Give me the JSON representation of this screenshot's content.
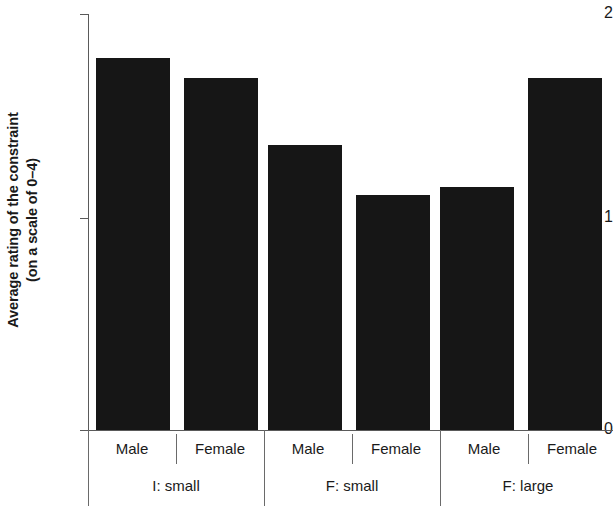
{
  "chart_data": {
    "type": "bar",
    "title": "",
    "subtitle": "",
    "xlabel": "",
    "ylabel_line1": "Average rating of the constraint",
    "ylabel_line2": "(on a scale of 0–4)",
    "ylim": [
      0,
      2
    ],
    "yticks": [
      "0",
      "1",
      "2"
    ],
    "ytick_values": [
      0,
      1,
      2
    ],
    "grid": false,
    "legend": "none",
    "groups": [
      {
        "label": "I: small",
        "categories": [
          "Male",
          "Female"
        ],
        "values": [
          1.79,
          1.69
        ]
      },
      {
        "label": "F: small",
        "categories": [
          "Male",
          "Female"
        ],
        "values": [
          1.37,
          1.13
        ]
      },
      {
        "label": "F: large",
        "categories": [
          "Male",
          "Female"
        ],
        "values": [
          1.17,
          1.69
        ]
      }
    ],
    "categories": [
      "Male",
      "Female",
      "Male",
      "Female",
      "Male",
      "Female"
    ],
    "values": [
      1.79,
      1.69,
      1.37,
      1.13,
      1.17,
      1.69
    ],
    "bar_color": "#161616",
    "axis_color": "#5a5a5a"
  },
  "axis": {
    "tick0": "0",
    "tick1": "1",
    "tick2": "2"
  },
  "labels": {
    "male_1": "Male",
    "female_1": "Female",
    "male_2": "Male",
    "female_2": "Female",
    "male_3": "Male",
    "female_3": "Female",
    "group_1": "I: small",
    "group_2": "F: small",
    "group_3": "F: large"
  }
}
